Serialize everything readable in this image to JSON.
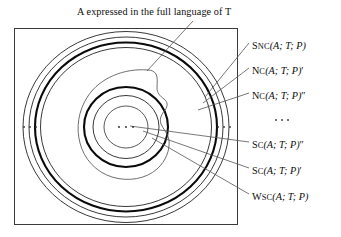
{
  "figure": {
    "title": "A expressed in the full language of T",
    "title_parts": {
      "symbol_a": "A",
      "middle": " expressed in the full language of ",
      "symbol_t": "T"
    },
    "frame": {
      "x": 14,
      "y": 28,
      "width": 224,
      "height": 197,
      "stroke": "#333333"
    },
    "background": "#ffffff",
    "line_color": "#111111",
    "leader_color": "#555555",
    "center": {
      "x": 126,
      "y": 127
    },
    "ellipsis_left": "· · ·",
    "ellipsis_right": "· · ·",
    "ellipsis_center": "· · ·",
    "ellipsis_labels": "· · ·",
    "rings": [
      {
        "name": "snc-outer-ring",
        "rx": 103,
        "ry": 96,
        "stroke_width": 0.8
      },
      {
        "name": "nc-prime-ring",
        "rx": 97,
        "ry": 90,
        "stroke_width": 0.8
      },
      {
        "name": "nc-double-prime-ring",
        "rx": 91,
        "ry": 85,
        "stroke_width": 2.0
      },
      {
        "name": "wsc-ring",
        "rx": 86,
        "ry": 80,
        "stroke_width": 0.8
      },
      {
        "name": "sc-double-prime-ring",
        "rx": 42,
        "ry": 40,
        "stroke_width": 2.0
      },
      {
        "name": "sc-prime-ring",
        "rx": 33,
        "ry": 31,
        "stroke_width": 0.8
      },
      {
        "name": "inner-core-ring",
        "rx": 22,
        "ry": 21,
        "stroke_width": 0.8
      }
    ],
    "blob": {
      "name": "set-a-blob",
      "description": "irregular closed contour representing A"
    },
    "labels": [
      {
        "id": "snc",
        "name": "label-snc",
        "lead": "S",
        "lead_rest": "NC",
        "args": "(A; T; P)",
        "primes": "",
        "y": 46
      },
      {
        "id": "nc1",
        "name": "label-nc-prime",
        "lead": "N",
        "lead_rest": "C",
        "args": "(A; T; P)",
        "primes": "′",
        "y": 71
      },
      {
        "id": "nc2",
        "name": "label-nc-double-prime",
        "lead": "N",
        "lead_rest": "C",
        "args": "(A; T; P)",
        "primes": "″",
        "y": 96
      },
      {
        "id": "sc2",
        "name": "label-sc-double-prime",
        "lead": "S",
        "lead_rest": "C",
        "args": "(A; T; P)",
        "primes": "″",
        "y": 145
      },
      {
        "id": "sc1",
        "name": "label-sc-prime",
        "lead": "S",
        "lead_rest": "C",
        "args": "(A; T; P)",
        "primes": "′",
        "y": 171
      },
      {
        "id": "wsc",
        "name": "label-wsc",
        "lead": "W",
        "lead_rest": "SC",
        "args": "(A; T; P)",
        "primes": "",
        "y": 197
      }
    ],
    "label_x": 252,
    "dots_label": {
      "text": "· · ·",
      "x": 281,
      "y": 120
    }
  }
}
